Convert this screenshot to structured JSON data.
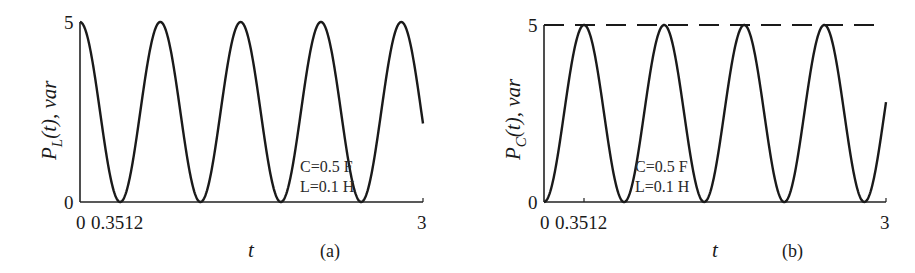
{
  "chart_data": [
    {
      "type": "line",
      "panel_label": "(a)",
      "ylabel_main": "P",
      "ylabel_sub": "L",
      "ylabel_rest": "(t), var",
      "xlabel": "t",
      "xlim": [
        0,
        3
      ],
      "ylim": [
        0,
        5
      ],
      "xticks": [
        "0",
        "0.3512",
        "3"
      ],
      "xtick_values": [
        0,
        0.3512,
        3
      ],
      "yticks": [
        "0",
        "5"
      ],
      "ytick_values": [
        0,
        5
      ],
      "grid": false,
      "annotations": [
        "C=0.5 F",
        "L=0.1 H"
      ],
      "series": [
        {
          "name": "P_L(t)",
          "formula": "5*cos^2(4.472 t)",
          "amplitude": 5,
          "omega": 4.472,
          "phase": "cos",
          "style": "solid"
        }
      ]
    },
    {
      "type": "line",
      "panel_label": "(b)",
      "ylabel_main": "P",
      "ylabel_sub": "C",
      "ylabel_rest": "(t), var",
      "xlabel": "t",
      "xlim": [
        0,
        3
      ],
      "ylim": [
        0,
        5
      ],
      "xticks": [
        "0",
        "0.3512",
        "3"
      ],
      "xtick_values": [
        0,
        0.3512,
        3
      ],
      "yticks": [
        "0",
        "5"
      ],
      "ytick_values": [
        0,
        5
      ],
      "grid": false,
      "annotations": [
        "C=0.5 F",
        "L=0.1 H"
      ],
      "series": [
        {
          "name": "P_C(t)",
          "formula": "5*sin^2(4.472 t)",
          "amplitude": 5,
          "omega": 4.472,
          "phase": "sin",
          "style": "solid"
        },
        {
          "name": "max level",
          "value": 5,
          "style": "dashed"
        }
      ]
    }
  ]
}
